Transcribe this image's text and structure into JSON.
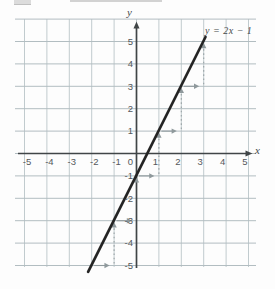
{
  "chart_data": {
    "type": "line",
    "title": "",
    "equation_label": "y = 2x − 1",
    "x_axis_label": "x",
    "y_axis_label": "y",
    "origin_label": "0",
    "x_ticks": [
      -5,
      -4,
      -3,
      -2,
      -1,
      1,
      2,
      3,
      4,
      5
    ],
    "y_ticks": [
      5,
      4,
      3,
      2,
      1,
      -1,
      -2,
      -3,
      -4,
      -5
    ],
    "xlim": [
      -5.5,
      5.7
    ],
    "ylim": [
      -5.4,
      6.1
    ],
    "grid": true,
    "series": [
      {
        "name": "y = 2x − 1",
        "slope": 2,
        "intercept": -1,
        "points": [
          [
            -2,
            -5
          ],
          [
            -1,
            -3
          ],
          [
            0,
            -1
          ],
          [
            1,
            1
          ],
          [
            2,
            3
          ],
          [
            3,
            5
          ]
        ],
        "segment": {
          "x1": -2.16,
          "y1": -5.28,
          "x2": 3.08,
          "y2": 5.2
        }
      }
    ],
    "annotations": {
      "run": 1,
      "rise": 2,
      "run_arrows": [
        {
          "y": -5,
          "from_x": -2,
          "to_x": -1.2
        },
        {
          "y": -3,
          "from_x": -1,
          "to_x": -0.2
        },
        {
          "y": -1,
          "from_x": 0,
          "to_x": 0.8
        },
        {
          "y": 1,
          "from_x": 1,
          "to_x": 1.8
        },
        {
          "y": 3,
          "from_x": 2,
          "to_x": 2.8
        }
      ],
      "rise_arrows": [
        {
          "x": -1,
          "from_y": -5,
          "to_y": -3,
          "style": "dotted"
        },
        {
          "x": 0,
          "from_y": -3,
          "to_y": -1,
          "style": "head-only"
        },
        {
          "x": 1,
          "from_y": -1,
          "to_y": 1,
          "style": "dotted"
        },
        {
          "x": 2,
          "from_y": 1,
          "to_y": 3,
          "style": "dotted"
        },
        {
          "x": 3,
          "from_y": 3,
          "to_y": 5,
          "style": "dotted"
        }
      ]
    }
  },
  "colors": {
    "grid_vertical": "#c1cbce",
    "grid_horizontal": "#b2bdc1",
    "axis": "#404547",
    "function_line": "#242424",
    "annotation": "#8f999c",
    "dotted": "#9aa3a6",
    "tick_text": "#54585b",
    "equation_text": "#45494b"
  }
}
